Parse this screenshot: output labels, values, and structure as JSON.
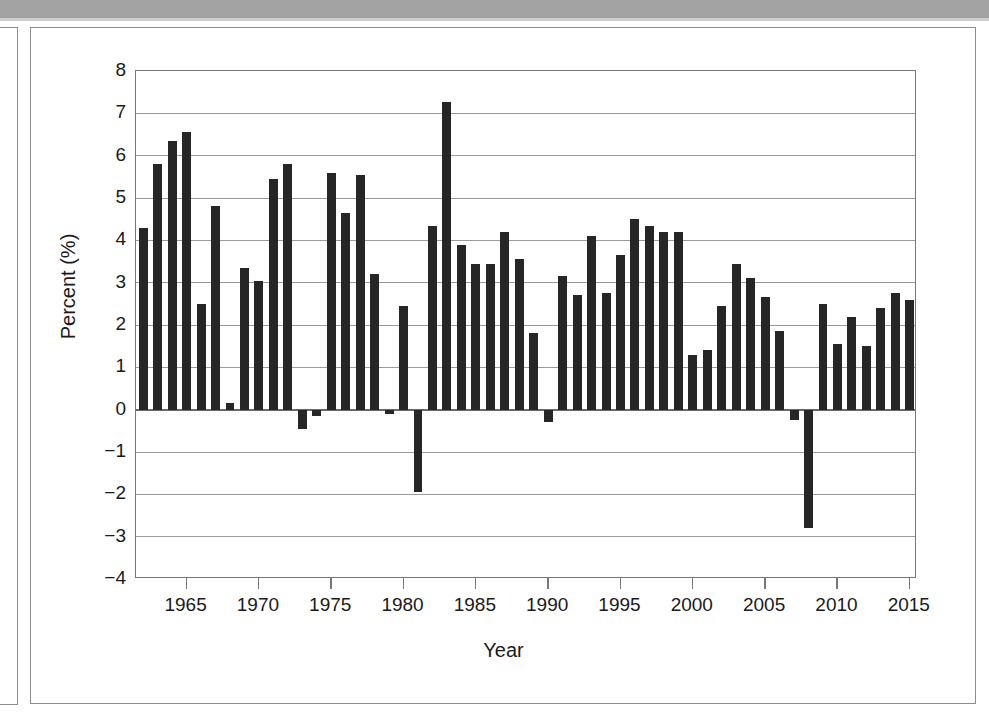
{
  "figure": {
    "frame": {
      "has_outer_frame": true,
      "has_inner_frame": true,
      "scan_band_color": "#a3a3a3"
    }
  },
  "chart_data": {
    "type": "bar",
    "title": "",
    "xlabel": "Year",
    "ylabel": "Percent (%)",
    "ylim": [
      -4,
      8
    ],
    "xlim": [
      1961.5,
      2015.5
    ],
    "ytick_labels": [
      "8",
      "7",
      "6",
      "5",
      "4",
      "3",
      "2",
      "1",
      "0",
      "−1",
      "−2",
      "−3",
      "−4"
    ],
    "ytick_values": [
      8,
      7,
      6,
      5,
      4,
      3,
      2,
      1,
      0,
      -1,
      -2,
      -3,
      -4
    ],
    "xtick_labels": [
      "1965",
      "1970",
      "1975",
      "1980",
      "1985",
      "1990",
      "1995",
      "2000",
      "2005",
      "2010",
      "2015"
    ],
    "xtick_values": [
      1965,
      1970,
      1975,
      1980,
      1985,
      1990,
      1995,
      2000,
      2005,
      2010,
      2015
    ],
    "grid": "horizontal",
    "legend": "none",
    "bar_color": "#262626",
    "categories": [
      1962,
      1963,
      1964,
      1965,
      1966,
      1967,
      1968,
      1969,
      1970,
      1971,
      1972,
      1973,
      1974,
      1975,
      1976,
      1977,
      1978,
      1979,
      1980,
      1981,
      1982,
      1983,
      1984,
      1985,
      1986,
      1987,
      1988,
      1989,
      1990,
      1991,
      1992,
      1993,
      1994,
      1995,
      1996,
      1997,
      1998,
      1999,
      2000,
      2001,
      2002,
      2003,
      2004,
      2005,
      2006,
      2007,
      2008,
      2009,
      2010,
      2011,
      2012,
      2013,
      2014,
      2015
    ],
    "values": [
      4.3,
      5.8,
      6.35,
      6.55,
      2.5,
      4.8,
      0.15,
      3.35,
      3.05,
      5.45,
      5.8,
      -0.45,
      -0.15,
      5.6,
      4.65,
      5.55,
      3.2,
      -0.1,
      2.45,
      -1.95,
      4.35,
      7.27,
      3.9,
      3.45,
      3.45,
      4.2,
      3.55,
      1.8,
      -0.3,
      3.15,
      2.7,
      4.1,
      2.75,
      3.65,
      4.5,
      4.35,
      4.2,
      4.2,
      1.3,
      1.4,
      2.45,
      3.45,
      3.1,
      2.65,
      1.85,
      -0.25,
      -2.8,
      2.5,
      1.55,
      2.2,
      1.5,
      2.4,
      2.75,
      2.6
    ],
    "bar_width_fraction": 0.62
  }
}
